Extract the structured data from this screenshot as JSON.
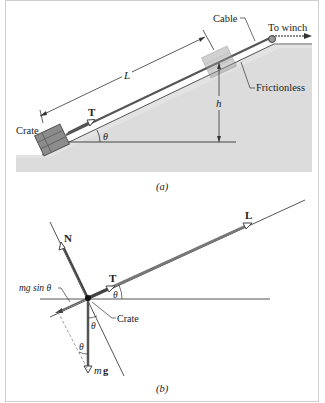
{
  "panel_a": {
    "caption": "(a)",
    "labels": {
      "cable": "Cable",
      "to_winch": "To winch",
      "frictionless": "Frictionless",
      "crate": "Crate",
      "length": "L",
      "height": "h",
      "tension": "T",
      "angle": "θ"
    },
    "colors": {
      "slope_fill": "#d9d9d9",
      "crate": "#8a8a8a",
      "line": "#333333"
    }
  },
  "panel_b": {
    "caption": "(b)",
    "labels": {
      "normal": "N",
      "displacement": "L",
      "tension": "T",
      "mg_sin": "mg sin θ",
      "crate": "Crate",
      "weight_m": "m",
      "weight_g": "g",
      "angle_t": "θ",
      "angle_1": "θ",
      "angle_2": "θ"
    },
    "colors": {
      "vector": "#555555",
      "axis": "#444444"
    }
  }
}
